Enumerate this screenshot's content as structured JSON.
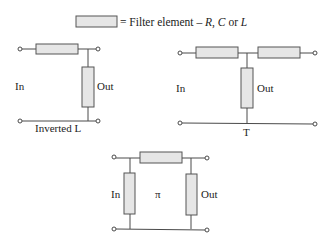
{
  "legend": {
    "prefix": "= Filter element – ",
    "r": "R",
    "sep1": ", ",
    "c": "C",
    "or": " or ",
    "l": "L"
  },
  "circuits": {
    "inverted_l": {
      "name": "Inverted L",
      "in": "In",
      "out": "Out"
    },
    "t": {
      "name": "T",
      "in": "In",
      "out": "Out"
    },
    "pi": {
      "name": "π",
      "in": "In",
      "out": "Out"
    }
  },
  "colors": {
    "element_fill": "#e6e6e6",
    "element_stroke": "#555555",
    "wire": "#4a4a4a"
  }
}
